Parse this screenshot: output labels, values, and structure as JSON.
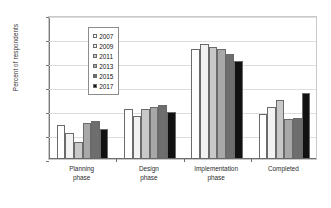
{
  "chart_data": {
    "type": "bar",
    "title": "",
    "xlabel": "",
    "ylabel": "Percent of respondents",
    "ylim": [
      0,
      60
    ],
    "ytick_labels": [
      "0%",
      "10%",
      "20%",
      "30%",
      "40%",
      "50%",
      "60%"
    ],
    "ytick_values": [
      0,
      10,
      20,
      30,
      40,
      50,
      60
    ],
    "grid": true,
    "legend_position": "upper-left-inside",
    "categories": [
      "Planning\nphase",
      "Design\nphase",
      "Implementation\nphase",
      "Completed"
    ],
    "category_labels_flat": [
      "Planning phase",
      "Design phase",
      "Implementation phase",
      "Completed"
    ],
    "series": [
      {
        "name": "2007",
        "color": "#ffffff",
        "values": [
          14.0,
          21.0,
          45.8,
          18.8
        ]
      },
      {
        "name": "2009",
        "color": "#f2f2f2",
        "values": [
          11.0,
          18.0,
          47.8,
          21.6
        ]
      },
      {
        "name": "2011",
        "color": "#c8c8c8",
        "values": [
          7.0,
          21.0,
          46.8,
          24.5
        ]
      },
      {
        "name": "2013",
        "color": "#a8a8a8",
        "values": [
          15.0,
          21.8,
          45.9,
          16.6
        ]
      },
      {
        "name": "2015",
        "color": "#6e6e6e",
        "values": [
          16.0,
          22.5,
          43.8,
          17.0
        ]
      },
      {
        "name": "2017",
        "color": "#111111",
        "values": [
          12.3,
          19.4,
          40.7,
          27.3
        ]
      }
    ]
  },
  "legend": {
    "items": [
      {
        "label": "2007"
      },
      {
        "label": "2009"
      },
      {
        "label": "2011"
      },
      {
        "label": "2013"
      },
      {
        "label": "2015"
      },
      {
        "label": "2017"
      }
    ]
  },
  "axis": {
    "y_title": "Percent of respondents"
  }
}
